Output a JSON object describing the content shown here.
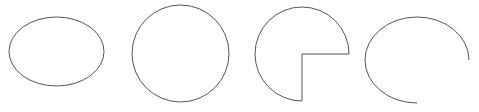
{
  "canvas": {
    "width": 479,
    "height": 112,
    "background": "#ffffff"
  },
  "stroke": {
    "color": "#555555",
    "width": 1
  },
  "shapes": [
    {
      "name": "ellipse",
      "type": "ellipse",
      "cx": 56.5,
      "cy": 51.5,
      "rx": 47.5,
      "ry": 34.5
    },
    {
      "name": "circle",
      "type": "circle",
      "cx": 180.5,
      "cy": 53.5,
      "r": 48.5
    },
    {
      "name": "pie",
      "type": "pie",
      "cx": 302,
      "cy": 54,
      "r": 47,
      "missing_quadrant": "bottom-right"
    },
    {
      "name": "arc",
      "type": "elliptical-arc",
      "cx": 417,
      "cy": 60,
      "rx": 52,
      "ry": 43,
      "start": "right",
      "end": "bottom",
      "direction": "counter-clockwise"
    }
  ]
}
